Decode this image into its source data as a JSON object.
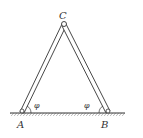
{
  "diagram": {
    "type": "physics-figure",
    "labels": {
      "apex": "C",
      "left_base": "A",
      "right_base": "B",
      "left_angle": "φ",
      "right_angle": "φ"
    },
    "colors": {
      "stroke": "#333333",
      "background": "#ffffff"
    }
  }
}
